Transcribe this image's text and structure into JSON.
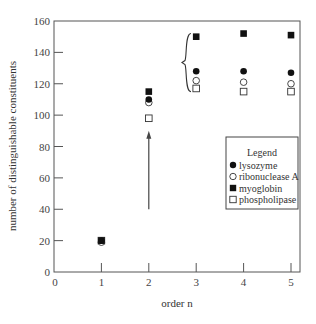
{
  "chart_data": {
    "type": "scatter",
    "title": "",
    "xlabel": "order n",
    "ylabel": "number of distinguishable constituents",
    "xlim": [
      0,
      5
    ],
    "ylim": [
      0,
      160
    ],
    "xticks": [
      0,
      1,
      2,
      3,
      4,
      5
    ],
    "yticks": [
      0,
      20,
      40,
      60,
      80,
      100,
      120,
      140,
      160
    ],
    "grid": false,
    "legend_position": "lower right (inside)",
    "legend_title": "Legend",
    "x": [
      1,
      2,
      3,
      4,
      5
    ],
    "series": [
      {
        "name": "lysozyme",
        "marker": "filled-circle",
        "values": [
          20,
          110,
          128,
          128,
          127
        ]
      },
      {
        "name": "ribonuclease A",
        "marker": "open-circle",
        "values": [
          19,
          108,
          122,
          121,
          120
        ]
      },
      {
        "name": "myoglobin",
        "marker": "filled-square",
        "values": [
          20,
          115,
          150,
          152,
          151
        ]
      },
      {
        "name": "phospholipase",
        "marker": "open-square",
        "values": [
          20,
          98,
          117,
          115,
          115
        ]
      }
    ],
    "annotations": [
      {
        "type": "arrow",
        "x": 2,
        "from_y": 40,
        "to_y": 90
      },
      {
        "type": "brace",
        "x": 2.7,
        "from_y": 115,
        "to_y": 152
      }
    ]
  }
}
